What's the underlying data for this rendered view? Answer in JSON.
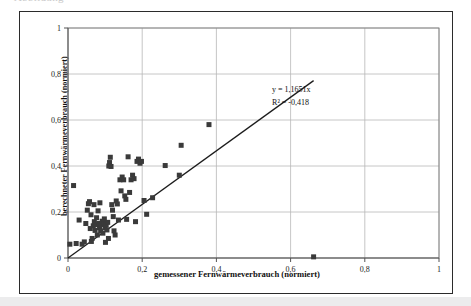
{
  "scan": {
    "top_ghost_text": "Abbildung                                                                                                                                                                  ",
    "bottom_band": true
  },
  "chart_data": {
    "type": "scatter",
    "title": "",
    "xlabel": "gemessener Fernwärmeverbrauch (normiert)",
    "ylabel": "berechneter Fernwärmeverbrauch (normiert)",
    "xlim": [
      0,
      1
    ],
    "ylim": [
      0,
      1
    ],
    "xticks": [
      "0",
      "0,2",
      "0,4",
      "0,6",
      "0,8",
      "1"
    ],
    "yticks": [
      "0",
      "0,2",
      "0,4",
      "0,6",
      "0,8",
      "1"
    ],
    "xtick_values": [
      0,
      0.2,
      0.4,
      0.6,
      0.8,
      1
    ],
    "ytick_values": [
      0,
      0.2,
      0.4,
      0.6,
      0.8,
      1
    ],
    "grid": true,
    "legend": "none",
    "marker": "filled-square",
    "marker_color": "#3a3a3a",
    "marker_size_px": 5,
    "annotations": [
      {
        "text": "y = 1,1651x",
        "x": 0.55,
        "y": 0.72
      },
      {
        "text": "R² = -0,418",
        "x": 0.55,
        "y": 0.665
      }
    ],
    "trendline": {
      "type": "linear-through-origin",
      "slope": 1.1651,
      "intercept": 0,
      "r2": -0.418,
      "equation": "y = 1,1651x",
      "r2_label": "R² = -0,418",
      "x_start": 0.0,
      "x_end": 0.662,
      "color": "#1c1c1c"
    },
    "points": [
      [
        0.015,
        0.315
      ],
      [
        0.005,
        0.06
      ],
      [
        0.022,
        0.063
      ],
      [
        0.03,
        0.165
      ],
      [
        0.038,
        0.06
      ],
      [
        0.044,
        0.07
      ],
      [
        0.048,
        0.15
      ],
      [
        0.052,
        0.208
      ],
      [
        0.055,
        0.236
      ],
      [
        0.058,
        0.245
      ],
      [
        0.06,
        0.128
      ],
      [
        0.062,
        0.188
      ],
      [
        0.063,
        0.072
      ],
      [
        0.065,
        0.085
      ],
      [
        0.068,
        0.14
      ],
      [
        0.07,
        0.232
      ],
      [
        0.071,
        0.158
      ],
      [
        0.073,
        0.12
      ],
      [
        0.075,
        0.145
      ],
      [
        0.077,
        0.175
      ],
      [
        0.079,
        0.1
      ],
      [
        0.081,
        0.205
      ],
      [
        0.083,
        0.15
      ],
      [
        0.085,
        0.132
      ],
      [
        0.086,
        0.24
      ],
      [
        0.088,
        0.118
      ],
      [
        0.09,
        0.145
      ],
      [
        0.092,
        0.16
      ],
      [
        0.094,
        0.108
      ],
      [
        0.096,
        0.15
      ],
      [
        0.098,
        0.17
      ],
      [
        0.1,
        0.132
      ],
      [
        0.101,
        0.068
      ],
      [
        0.103,
        0.143
      ],
      [
        0.105,
        0.122
      ],
      [
        0.107,
        0.155
      ],
      [
        0.109,
        0.085
      ],
      [
        0.11,
        0.4
      ],
      [
        0.112,
        0.415
      ],
      [
        0.114,
        0.438
      ],
      [
        0.116,
        0.398
      ],
      [
        0.118,
        0.232
      ],
      [
        0.12,
        0.208
      ],
      [
        0.122,
        0.18
      ],
      [
        0.124,
        0.118
      ],
      [
        0.127,
        0.1
      ],
      [
        0.13,
        0.248
      ],
      [
        0.133,
        0.235
      ],
      [
        0.136,
        0.165
      ],
      [
        0.14,
        0.34
      ],
      [
        0.143,
        0.292
      ],
      [
        0.146,
        0.352
      ],
      [
        0.15,
        0.34
      ],
      [
        0.153,
        0.27
      ],
      [
        0.156,
        0.255
      ],
      [
        0.158,
        0.168
      ],
      [
        0.162,
        0.44
      ],
      [
        0.166,
        0.285
      ],
      [
        0.17,
        0.34
      ],
      [
        0.174,
        0.36
      ],
      [
        0.178,
        0.345
      ],
      [
        0.182,
        0.158
      ],
      [
        0.186,
        0.42
      ],
      [
        0.19,
        0.43
      ],
      [
        0.194,
        0.412
      ],
      [
        0.198,
        0.42
      ],
      [
        0.205,
        0.25
      ],
      [
        0.212,
        0.19
      ],
      [
        0.228,
        0.262
      ],
      [
        0.262,
        0.402
      ],
      [
        0.3,
        0.36
      ],
      [
        0.305,
        0.49
      ],
      [
        0.38,
        0.58
      ],
      [
        0.662,
        0.005
      ]
    ]
  }
}
